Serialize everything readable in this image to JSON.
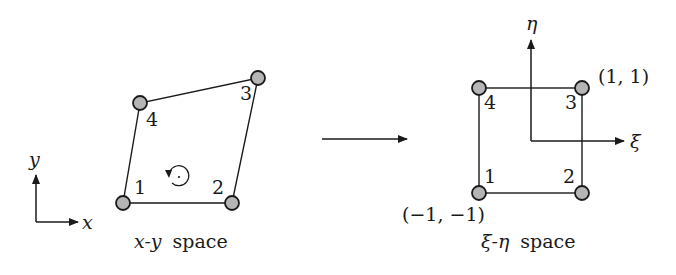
{
  "diagram": {
    "type": "isoparametric-mapping",
    "colors": {
      "line": "#1a1a1a",
      "node_fill": "#b5b5b5",
      "node_stroke": "#1a1a1a",
      "background": "#ffffff"
    },
    "left": {
      "caption_var": "x-y",
      "caption_word": "space",
      "axes": {
        "x_label": "x",
        "y_label": "y"
      },
      "nodes": [
        {
          "id": "1",
          "label": "1",
          "cx": 123,
          "cy": 203
        },
        {
          "id": "2",
          "label": "2",
          "cx": 232,
          "cy": 203
        },
        {
          "id": "3",
          "label": "3",
          "cx": 258,
          "cy": 78
        },
        {
          "id": "4",
          "label": "4",
          "cx": 140,
          "cy": 103
        }
      ],
      "orientation_symbol": "counter-clockwise"
    },
    "mapping_arrow": {
      "direction": "right"
    },
    "right": {
      "caption_var": "ξ-η",
      "caption_word": "space",
      "axes": {
        "xi_label": "ξ",
        "eta_label": "η"
      },
      "nodes": [
        {
          "id": "1",
          "label": "1",
          "cx": 479,
          "cy": 193
        },
        {
          "id": "2",
          "label": "2",
          "cx": 582,
          "cy": 193
        },
        {
          "id": "3",
          "label": "3",
          "cx": 582,
          "cy": 88
        },
        {
          "id": "4",
          "label": "4",
          "cx": 479,
          "cy": 88
        }
      ],
      "corner_labels": {
        "top_right": "(1, 1)",
        "bottom_left": "(−1, −1)"
      }
    }
  }
}
